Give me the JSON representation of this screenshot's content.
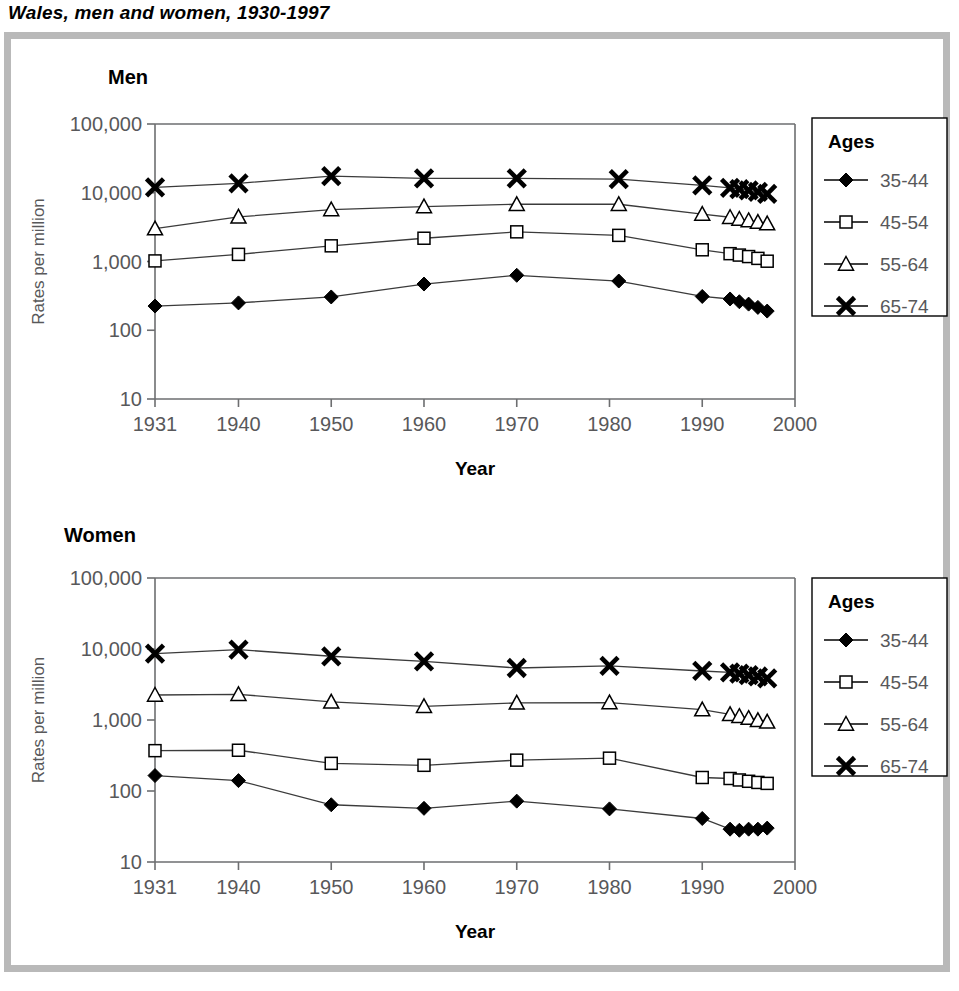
{
  "figure": {
    "title": "Wales, men and women, 1930-1997",
    "frame_color": "#b9b9b9",
    "text_color": "#58585a"
  },
  "panels": [
    {
      "id": "men",
      "heading": "Men"
    },
    {
      "id": "women",
      "heading": "Women"
    }
  ],
  "axes": {
    "x_title": "Year",
    "y_title": "Rates per million",
    "x_ticks": [
      "1931",
      "1940",
      "1950",
      "1960",
      "1970",
      "1980",
      "1990",
      "2000"
    ],
    "y_ticks": [
      "100,000",
      "10,000",
      "1,000",
      "100",
      "10"
    ]
  },
  "legend": {
    "title": "Ages",
    "entries": [
      {
        "label": "35-44",
        "marker": "diamond"
      },
      {
        "label": "45-54",
        "marker": "square"
      },
      {
        "label": "55-64",
        "marker": "triangle"
      },
      {
        "label": "65-74",
        "marker": "cross"
      }
    ]
  },
  "chart_data": [
    {
      "type": "line",
      "title": "Men",
      "xlabel": "Year",
      "ylabel": "Rates per million",
      "yscale": "log",
      "ylim": [
        10,
        100000
      ],
      "xlim": [
        1931,
        2000
      ],
      "xticks": [
        1931,
        1940,
        1950,
        1960,
        1970,
        1980,
        1990,
        2000
      ],
      "yticks": [
        10,
        100,
        1000,
        10000,
        100000
      ],
      "grid": false,
      "legend_position": "right",
      "legend_title": "Ages",
      "series": [
        {
          "name": "35-44",
          "marker": "diamond",
          "x": [
            1931,
            1940,
            1950,
            1960,
            1970,
            1981,
            1990,
            1993,
            1994,
            1995,
            1996,
            1997
          ],
          "y": [
            225,
            250,
            305,
            470,
            630,
            520,
            310,
            285,
            260,
            240,
            215,
            190
          ]
        },
        {
          "name": "45-54",
          "marker": "square",
          "x": [
            1931,
            1940,
            1950,
            1960,
            1970,
            1981,
            1990,
            1993,
            1994,
            1995,
            1996,
            1997
          ],
          "y": [
            1020,
            1270,
            1690,
            2180,
            2700,
            2400,
            1480,
            1300,
            1240,
            1180,
            1110,
            1010
          ]
        },
        {
          "name": "55-64",
          "marker": "triangle",
          "x": [
            1931,
            1940,
            1950,
            1960,
            1970,
            1981,
            1990,
            1993,
            1994,
            1995,
            1996,
            1997
          ],
          "y": [
            3000,
            4450,
            5700,
            6300,
            6800,
            6800,
            4900,
            4400,
            4150,
            3950,
            3750,
            3550
          ]
        },
        {
          "name": "65-74",
          "marker": "cross",
          "x": [
            1931,
            1940,
            1950,
            1960,
            1970,
            1981,
            1990,
            1993,
            1994,
            1995,
            1996,
            1997
          ],
          "y": [
            12000,
            13700,
            17500,
            16200,
            16200,
            15800,
            12800,
            11800,
            11300,
            10800,
            10300,
            9600
          ]
        }
      ]
    },
    {
      "type": "line",
      "title": "Women",
      "xlabel": "Year",
      "ylabel": "Rates per million",
      "yscale": "log",
      "ylim": [
        10,
        100000
      ],
      "xlim": [
        1931,
        2000
      ],
      "xticks": [
        1931,
        1940,
        1950,
        1960,
        1970,
        1980,
        1990,
        2000
      ],
      "yticks": [
        10,
        100,
        1000,
        10000,
        100000
      ],
      "grid": false,
      "legend_position": "right",
      "legend_title": "Ages",
      "series": [
        {
          "name": "35-44",
          "marker": "diamond",
          "x": [
            1931,
            1940,
            1950,
            1960,
            1970,
            1980,
            1990,
            1993,
            1994,
            1995,
            1996,
            1997
          ],
          "y": [
            165,
            140,
            64,
            57,
            72,
            56,
            41,
            29,
            28,
            29,
            29,
            30
          ]
        },
        {
          "name": "45-54",
          "marker": "square",
          "x": [
            1931,
            1940,
            1950,
            1960,
            1970,
            1980,
            1990,
            1993,
            1994,
            1995,
            1996,
            1997
          ],
          "y": [
            370,
            375,
            245,
            230,
            272,
            290,
            155,
            150,
            143,
            137,
            132,
            128
          ]
        },
        {
          "name": "55-64",
          "marker": "triangle",
          "x": [
            1931,
            1940,
            1950,
            1960,
            1970,
            1980,
            1990,
            1993,
            1994,
            1995,
            1996,
            1997
          ],
          "y": [
            2250,
            2300,
            1800,
            1560,
            1740,
            1760,
            1400,
            1200,
            1130,
            1060,
            990,
            940
          ]
        },
        {
          "name": "65-74",
          "marker": "cross",
          "x": [
            1931,
            1940,
            1950,
            1960,
            1970,
            1980,
            1990,
            1993,
            1994,
            1995,
            1996,
            1997
          ],
          "y": [
            8600,
            9800,
            7900,
            6700,
            5400,
            5800,
            4900,
            4700,
            4500,
            4300,
            4100,
            3850
          ]
        }
      ]
    }
  ]
}
